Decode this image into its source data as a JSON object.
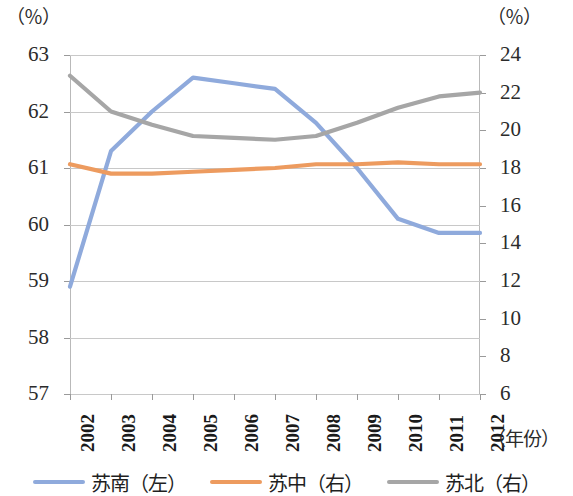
{
  "chart_data": {
    "type": "line",
    "title": "",
    "xlabel": "（年份）",
    "left_axis_unit": "（％）",
    "right_axis_unit": "（％）",
    "categories": [
      "2002",
      "2003",
      "2004",
      "2005",
      "2006",
      "2007",
      "2008",
      "2009",
      "2010",
      "2011",
      "2012"
    ],
    "left_ylim": [
      57,
      63
    ],
    "left_ticks": [
      "63",
      "62",
      "61",
      "60",
      "59",
      "58",
      "57"
    ],
    "right_ylim": [
      6,
      24
    ],
    "right_ticks": [
      "24",
      "22",
      "20",
      "18",
      "16",
      "14",
      "12",
      "10",
      "8",
      "6"
    ],
    "grid": true,
    "legend_position": "bottom",
    "series": [
      {
        "name": "苏南（左）",
        "axis": "left",
        "color": "#8faadc",
        "values": [
          58.9,
          61.3,
          62.0,
          62.6,
          62.5,
          62.4,
          61.8,
          61.0,
          60.1,
          59.85,
          59.85
        ]
      },
      {
        "name": "苏中（右）",
        "axis": "right",
        "color": "#ed9b5f",
        "values": [
          18.2,
          17.7,
          17.7,
          17.8,
          17.9,
          18.0,
          18.2,
          18.2,
          18.3,
          18.2,
          18.2
        ]
      },
      {
        "name": "苏北（右）",
        "axis": "right",
        "color": "#a6a6a6",
        "values": [
          22.9,
          21.0,
          20.3,
          19.7,
          19.6,
          19.5,
          19.7,
          20.4,
          21.2,
          21.8,
          22.0
        ]
      }
    ]
  }
}
